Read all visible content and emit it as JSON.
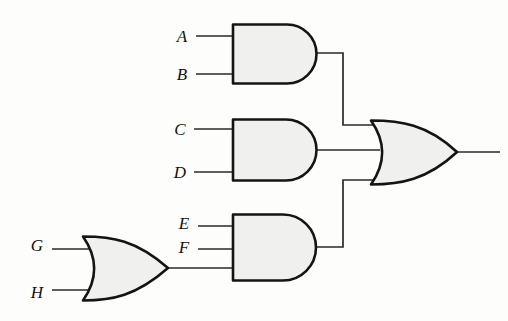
{
  "diagram": {
    "type": "logic-gate-schematic",
    "background_color": "#fdfdfc",
    "gate_fill_color": "#f0f0ef",
    "gate_stroke_color": "#141414",
    "wire_color": "#2a2a2a"
  },
  "inputs": [
    {
      "id": "A",
      "label": "A",
      "x": 182,
      "y": 36,
      "wire_y": 36,
      "gate": "and-gate-1"
    },
    {
      "id": "B",
      "label": "B",
      "x": 182,
      "y": 74,
      "wire_y": 74,
      "gate": "and-gate-1"
    },
    {
      "id": "C",
      "label": "C",
      "x": 180,
      "y": 129,
      "wire_y": 129,
      "gate": "and-gate-2"
    },
    {
      "id": "D",
      "label": "D",
      "x": 180,
      "y": 172,
      "wire_y": 172,
      "gate": "and-gate-2"
    },
    {
      "id": "E",
      "label": "E",
      "x": 184,
      "y": 223,
      "wire_y": 226,
      "gate": "and-gate-3"
    },
    {
      "id": "F",
      "label": "F",
      "x": 184,
      "y": 247,
      "wire_y": 249,
      "gate": "and-gate-3"
    },
    {
      "id": "G",
      "label": "G",
      "x": 37,
      "y": 245,
      "wire_y": 249,
      "gate": "or-gate-left"
    },
    {
      "id": "H",
      "label": "H",
      "x": 37,
      "y": 292,
      "wire_y": 290,
      "gate": "or-gate-left"
    }
  ],
  "gates": [
    {
      "id": "and-gate-1",
      "name": "and-gate-top",
      "type": "AND",
      "inputs": [
        "A",
        "B"
      ],
      "body": {
        "left": 232,
        "top": 24,
        "right": 316,
        "bottom": 83
      },
      "output": {
        "x": 316,
        "y": 53
      }
    },
    {
      "id": "and-gate-2",
      "name": "and-gate-middle",
      "type": "AND",
      "inputs": [
        "C",
        "D"
      ],
      "body": {
        "left": 232,
        "top": 119,
        "right": 316,
        "bottom": 180
      },
      "output": {
        "x": 316,
        "y": 150
      }
    },
    {
      "id": "and-gate-3",
      "name": "and-gate-bottom",
      "type": "AND",
      "inputs": [
        "E",
        "F",
        "or-gate-left"
      ],
      "body": {
        "left": 232,
        "top": 214,
        "right": 316,
        "bottom": 280
      },
      "output": {
        "x": 316,
        "y": 247
      }
    },
    {
      "id": "or-gate-left",
      "name": "or-gate-lower-left",
      "type": "OR",
      "inputs": [
        "G",
        "H"
      ],
      "body": {
        "left": 82,
        "top": 236,
        "right": 168,
        "bottom": 301
      },
      "output": {
        "x": 168,
        "y": 268
      }
    },
    {
      "id": "or-gate-out",
      "name": "or-gate-output",
      "type": "OR",
      "inputs": [
        "and-gate-1",
        "and-gate-2",
        "and-gate-3"
      ],
      "body": {
        "left": 370,
        "top": 120,
        "right": 458,
        "bottom": 185
      },
      "output": {
        "x": 458,
        "y": 152
      }
    }
  ],
  "wires": [
    {
      "id": "w-a",
      "name": "wire-a-to-and1",
      "path": "M 196 36 L 234 36"
    },
    {
      "id": "w-b",
      "name": "wire-b-to-and1",
      "path": "M 196 74 L 234 74"
    },
    {
      "id": "w-c",
      "name": "wire-c-to-and2",
      "path": "M 194 129 L 234 129"
    },
    {
      "id": "w-d",
      "name": "wire-d-to-and2",
      "path": "M 194 172 L 234 172"
    },
    {
      "id": "w-e",
      "name": "wire-e-to-and3",
      "path": "M 198 226 L 234 226"
    },
    {
      "id": "w-f",
      "name": "wire-f-to-and3",
      "path": "M 198 249 L 234 249"
    },
    {
      "id": "w-g",
      "name": "wire-g-to-or-left",
      "path": "M 52 249 L 90 249"
    },
    {
      "id": "w-h",
      "name": "wire-h-to-or-left",
      "path": "M 52 290 L 90 290"
    },
    {
      "id": "w-orleft-out",
      "name": "wire-or-left-to-and3",
      "path": "M 168 268 L 234 268"
    },
    {
      "id": "w-and1-out",
      "name": "wire-and1-to-or-out",
      "path": "M 316 53 L 343 53 L 343 125 L 372 125"
    },
    {
      "id": "w-and2-out",
      "name": "wire-and2-to-or-out",
      "path": "M 316 150 L 378 150"
    },
    {
      "id": "w-and3-out",
      "name": "wire-and3-to-or-out",
      "path": "M 316 247 L 343 247 L 343 180 L 372 180"
    },
    {
      "id": "w-final-out",
      "name": "wire-circuit-output",
      "path": "M 458 152 L 500 152"
    }
  ],
  "output": {
    "id": "OUT",
    "label": "",
    "x": 500,
    "y": 152
  }
}
